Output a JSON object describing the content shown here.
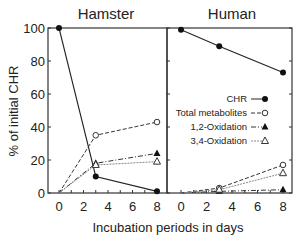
{
  "chart_data": [
    {
      "type": "line",
      "title": "Hamster",
      "xlabel": "Incubation periods in days",
      "ylabel": "% of initial CHR",
      "x": [
        0,
        3,
        8
      ],
      "xticks": [
        0,
        2,
        4,
        6,
        8
      ],
      "yticks": [
        0,
        20,
        40,
        60,
        80,
        100
      ],
      "xlim": [
        0,
        8
      ],
      "ylim": [
        0,
        100
      ],
      "grid": false,
      "series": [
        {
          "name": "CHR",
          "marker": "filled-circle",
          "line": "solid",
          "values": [
            100,
            10,
            1
          ]
        },
        {
          "name": "Total metabolites",
          "marker": "open-circle",
          "line": "dashed",
          "values": [
            0,
            35,
            43
          ]
        },
        {
          "name": "1,2-Oxidation",
          "marker": "filled-triangle",
          "line": "dash-dot",
          "values": [
            0,
            18,
            24
          ]
        },
        {
          "name": "3,4-Oxidation",
          "marker": "open-triangle",
          "line": "dotted",
          "values": [
            0,
            17,
            19
          ]
        }
      ]
    },
    {
      "type": "line",
      "title": "Human",
      "xlabel": "Incubation periods in days",
      "ylabel": "% of initial CHR",
      "x": [
        0,
        3,
        8
      ],
      "xticks": [
        0,
        2,
        4,
        6,
        8
      ],
      "yticks": [
        0,
        20,
        40,
        60,
        80,
        100
      ],
      "xlim": [
        0,
        8
      ],
      "ylim": [
        0,
        100
      ],
      "grid": false,
      "legend_position": "center-right",
      "series": [
        {
          "name": "CHR",
          "marker": "filled-circle",
          "line": "solid",
          "values": [
            99,
            89,
            73
          ]
        },
        {
          "name": "Total metabolites",
          "marker": "open-circle",
          "line": "dashed",
          "values": [
            0,
            3,
            17
          ]
        },
        {
          "name": "1,2-Oxidation",
          "marker": "filled-triangle",
          "line": "dash-dot",
          "values": [
            0,
            1,
            2
          ]
        },
        {
          "name": "3,4-Oxidation",
          "marker": "open-triangle",
          "line": "dotted",
          "values": [
            0,
            2,
            12
          ]
        }
      ]
    }
  ],
  "labels": {
    "title_left": "Hamster",
    "title_right": "Human",
    "xlabel": "Incubation periods in days",
    "ylabel": "% of initial CHR",
    "ytick_labels": [
      "0",
      "20",
      "40",
      "60",
      "80",
      "100"
    ],
    "xtick_labels": [
      "0",
      "2",
      "4",
      "6",
      "8"
    ],
    "legend": [
      "CHR",
      "Total metabolites",
      "1,2-Oxidation",
      "3,4-Oxidation"
    ]
  }
}
